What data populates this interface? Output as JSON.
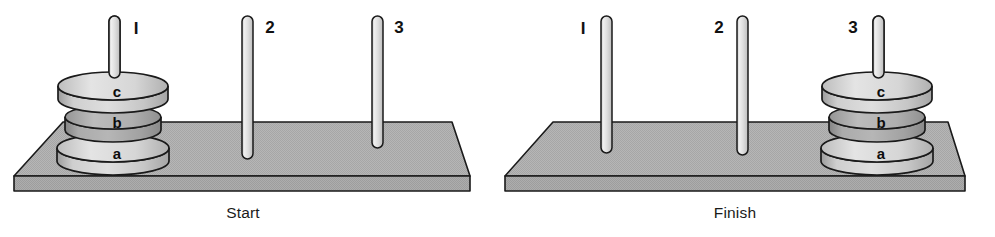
{
  "figure": {
    "background_color": "#ffffff",
    "outline_color": "#1a1a1a",
    "platform_top_color": "#b4b4b4",
    "platform_front_color": "#a8a8a8",
    "peg_color": "#dcdcdc",
    "disk_light_color": "#d2d2d2",
    "disk_mid_color": "#a9a9a9"
  },
  "panels": [
    {
      "id": "start",
      "caption": "Start",
      "caption_x": 243,
      "caption_y": 217,
      "pegs": [
        {
          "id": "peg-1",
          "label": "I",
          "x": 114,
          "label_x": 136,
          "label_y": 33,
          "top_y": 16,
          "bottom_y": 140
        },
        {
          "id": "peg-2",
          "label": "2",
          "x": 247,
          "label_x": 270,
          "label_y": 32,
          "top_y": 16,
          "bottom_y": 159
        },
        {
          "id": "peg-3",
          "label": "3",
          "x": 377,
          "label_x": 399,
          "label_y": 32,
          "top_y": 16,
          "bottom_y": 148
        }
      ],
      "platform": {
        "back_left_x": 63,
        "back_right_x": 452,
        "back_y": 122,
        "front_left_x": 14,
        "front_right_x": 470,
        "front_y": 176,
        "thickness": 15
      },
      "disks": [
        {
          "id": "disk-a",
          "label": "a",
          "peg": "peg-1",
          "cx": 113,
          "cy": 148,
          "rx": 56,
          "ry": 14,
          "height": 25,
          "shade": "light"
        },
        {
          "id": "disk-b",
          "label": "b",
          "peg": "peg-1",
          "cx": 113,
          "cy": 117,
          "rx": 48,
          "ry": 12,
          "height": 24,
          "shade": "mid"
        },
        {
          "id": "disk-c",
          "label": "c",
          "peg": "peg-1",
          "cx": 113,
          "cy": 86,
          "rx": 55,
          "ry": 14,
          "height": 24,
          "shade": "light"
        }
      ]
    },
    {
      "id": "finish",
      "caption": "Finish",
      "caption_x": 735,
      "caption_y": 217,
      "pegs": [
        {
          "id": "peg-1",
          "label": "I",
          "x": 606,
          "label_x": 583,
          "label_y": 33,
          "top_y": 16,
          "bottom_y": 153
        },
        {
          "id": "peg-2",
          "label": "2",
          "x": 742,
          "label_x": 719,
          "label_y": 32,
          "top_y": 16,
          "bottom_y": 155
        },
        {
          "id": "peg-3",
          "label": "3",
          "x": 878,
          "label_x": 853,
          "label_y": 32,
          "top_y": 16,
          "bottom_y": 140
        }
      ],
      "platform": {
        "back_left_x": 553,
        "back_right_x": 948,
        "back_y": 122,
        "front_left_x": 505,
        "front_right_x": 965,
        "front_y": 176,
        "thickness": 15
      },
      "disks": [
        {
          "id": "disk-a",
          "label": "a",
          "peg": "peg-3",
          "cx": 877,
          "cy": 148,
          "rx": 56,
          "ry": 14,
          "height": 25,
          "shade": "light"
        },
        {
          "id": "disk-b",
          "label": "b",
          "peg": "peg-3",
          "cx": 877,
          "cy": 117,
          "rx": 48,
          "ry": 12,
          "height": 24,
          "shade": "mid"
        },
        {
          "id": "disk-c",
          "label": "c",
          "peg": "peg-3",
          "cx": 877,
          "cy": 86,
          "rx": 55,
          "ry": 14,
          "height": 24,
          "shade": "light"
        }
      ]
    }
  ]
}
